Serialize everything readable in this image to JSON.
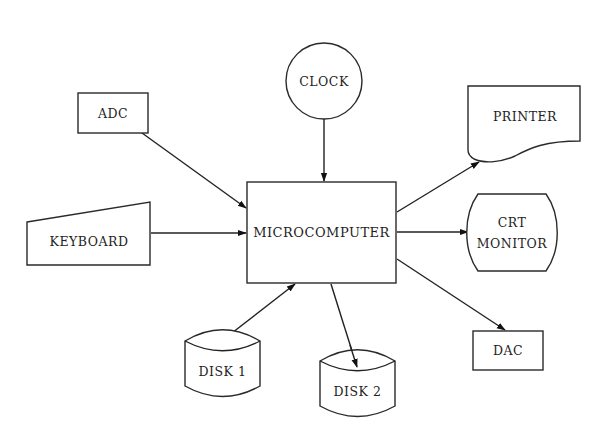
{
  "diagram": {
    "type": "block-diagram",
    "nodes": {
      "clock": {
        "label": "CLOCK",
        "shape": "circle"
      },
      "adc": {
        "label": "ADC",
        "shape": "rectangle"
      },
      "keyboard": {
        "label": "KEYBOARD",
        "shape": "manual-input"
      },
      "microcomputer": {
        "label": "MICROCOMPUTER",
        "shape": "rectangle"
      },
      "printer": {
        "label": "PRINTER",
        "shape": "document"
      },
      "crt": {
        "label_line1": "CRT",
        "label_line2": "MONITOR",
        "shape": "display"
      },
      "dac": {
        "label": "DAC",
        "shape": "rectangle"
      },
      "disk1": {
        "label": "DISK 1",
        "shape": "cylinder"
      },
      "disk2": {
        "label": "DISK 2",
        "shape": "cylinder"
      }
    },
    "edges": [
      {
        "from": "CLOCK",
        "to": "MICROCOMPUTER"
      },
      {
        "from": "ADC",
        "to": "MICROCOMPUTER"
      },
      {
        "from": "KEYBOARD",
        "to": "MICROCOMPUTER"
      },
      {
        "from": "DISK 1",
        "to": "MICROCOMPUTER"
      },
      {
        "from": "MICROCOMPUTER",
        "to": "PRINTER"
      },
      {
        "from": "MICROCOMPUTER",
        "to": "CRT MONITOR"
      },
      {
        "from": "MICROCOMPUTER",
        "to": "DAC"
      },
      {
        "from": "MICROCOMPUTER",
        "to": "DISK 2"
      }
    ]
  }
}
